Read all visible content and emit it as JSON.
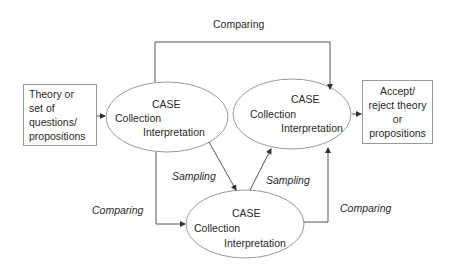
{
  "diagram": {
    "start_box": {
      "lines": [
        "Theory or",
        "set of",
        "questions/",
        "propositions"
      ]
    },
    "end_box": {
      "lines": [
        "Accept/",
        "reject theory",
        "or",
        "propositions"
      ]
    },
    "cases": [
      {
        "title": "CASE",
        "line1": "Collection",
        "line2": "Interpretation"
      },
      {
        "title": "CASE",
        "line1": "Collection",
        "line2": "Interpretation"
      },
      {
        "title": "CASE",
        "line1": "Collection",
        "line2": "Interpretation"
      }
    ],
    "edge_labels": {
      "top_comparing": "Comparing",
      "left_comparing": "Comparing",
      "right_comparing": "Comparing",
      "sampling_left": "Sampling",
      "sampling_right": "Sampling"
    },
    "colors": {
      "line": "#4a4a4a",
      "ellipse": "#9a9a9a",
      "box": "#9a9a9a"
    }
  }
}
